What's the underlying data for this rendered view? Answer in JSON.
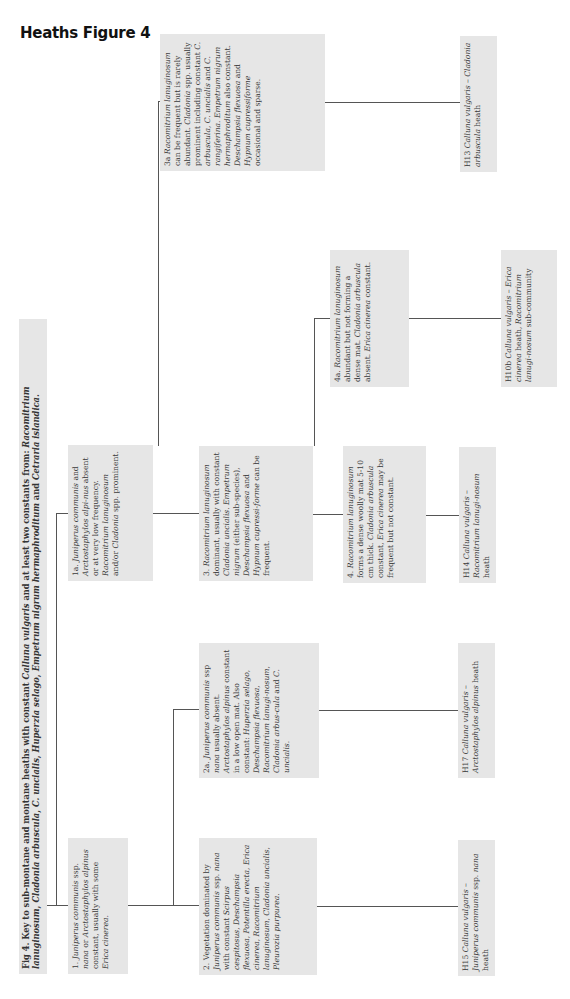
{
  "header": {
    "title": "Heaths Figure 4"
  },
  "caption": {
    "text_html": "Fig 4. Key to sub-montane and montane heaths with constant <i>Calluna vulgaris</i> and at least two constants from: <i>Racomitrium lanuginosum</i>, <i>Cladonia arbuscula</i>, <i>C. uncialis</i>, <i>Huperzia selago</i>, <i>Empetrum nigrum hermaphroditum</i> and <i>Cetraria islandica.</i>"
  },
  "nodes": {
    "n1": {
      "label": "1",
      "text_html": "1. <i>Juniperus communis</i> ssp. <i>nana</i> or <i>Arctostaphylos alpinus</i> constant, usually with some <i>Erica cinerea.</i>"
    },
    "n1a": {
      "label": "1a",
      "text_html": "1a. <i>Juniperus communis</i> and <i>Arctostaphylos alpi-nus</i> absent or at very low frequency. <i>Racomitrium lanuginosum</i> and/or <i>Cladonia</i> spp. prominent."
    },
    "n2": {
      "label": "2",
      "text_html": "2. Vegetation dominated by <i>Juniperus communis</i> ssp. <i>nana</i> with constant <i>Scirpus cespitosus, Deschampsia flexuosa, Potentilla erecta, Erica cinerea, Racomitrium lanuginosum, Cladonia uncialis, Pleurozia purpurea.</i>"
    },
    "n2a": {
      "label": "2a",
      "text_html": "2a. <i>Juniperus communis</i> ssp <i>nana</i> usually absent. <i>Arctostaphylos alpinus</i> constant in a low open mat. Also constant: <i>Huperzia selago, Deschampsia flexuosa, Racomitrium lanugi-nosum, Cladonia arbus-cula</i> and <i>C. uncialis.</i>"
    },
    "n3": {
      "label": "3",
      "text_html": "3. <i>Racomitrium lanuginosum</i> dominant, usually with constant <i>Cladonia uncialis. Empetrum nigrum</i> (either sub-species), <i>Deschampsia flexuosa</i> and <i>Hypnum cupressi-forme</i> can be frequent."
    },
    "n3a": {
      "label": "3a",
      "text_html": "3a <i>Racomitrium lanuginosum</i> can be frequent but is rarely abundant. <i>Cladonia</i> spp. usually prominent including constant <i>C. arbuscula, C. uncialis</i> and <i>C. rangiferina. Empetrum nigrum hermaphroditum</i> also constant. <i>Deschampsia flexuosa</i> and <i>Hypnum cupressiforme</i> occasional and sparse."
    },
    "n4": {
      "label": "4",
      "text_html": "4. <i>Racomitrium lanuginosum</i> forms a dense woolly mat 5-10 cm thick. <i>Cladonia arbuscula</i> constant, <i>Erica cinerea</i> may be frequent but not constant."
    },
    "n4a": {
      "label": "4a",
      "text_html": "4a. <i>Racomitrium lanuginosum</i> abundant but not forming a dense mat. <i>Cladonia arbuscula</i> absent. <i>Erica cinerea</i> constant."
    },
    "h13": {
      "label": "H13",
      "text_html": "H13 <i>Calluna vulgaris – Cladonia arbuscula</i> heath"
    },
    "h10b": {
      "label": "H10b",
      "text_html": "H10b <i>Calluna vulgaris – Erica cinerea</i> heath, <i>Racomitrium lanugi-nosum</i> sub-community"
    },
    "h14": {
      "label": "H14",
      "text_html": "H14 <i>Calluna vulgaris – Racomitrium lanugi-nosum</i> heath"
    },
    "h17": {
      "label": "H17",
      "text_html": "H17 <i>Calluna vulgaris – Arctostaphylos alpinus</i> heath"
    },
    "h15": {
      "label": "H15",
      "text_html": "H15 <i>Calluna vulgaris – Juniperus communis</i> ssp. <i>nana</i> heath"
    }
  },
  "edges": [
    [
      "caption",
      "n1"
    ],
    [
      "caption",
      "n1a"
    ],
    [
      "n1",
      "n2"
    ],
    [
      "n1",
      "n2a"
    ],
    [
      "n1a",
      "n3"
    ],
    [
      "n1a",
      "n3a"
    ],
    [
      "n3",
      "n4"
    ],
    [
      "n3",
      "n4a"
    ],
    [
      "n2",
      "h15"
    ],
    [
      "n2a",
      "h17"
    ],
    [
      "n4",
      "h14"
    ],
    [
      "n4a",
      "h10b"
    ],
    [
      "n3a",
      "h13"
    ]
  ],
  "colors": {
    "box_fill": "#e6e6e6",
    "line": "#555555",
    "text": "#3a3a3a"
  }
}
